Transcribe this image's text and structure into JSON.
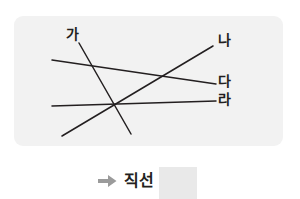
{
  "figure": {
    "panel": {
      "background_color": "#f2f2f2",
      "corner_radius": 9
    },
    "line_color": "#231f20",
    "labels": [
      {
        "id": "ga",
        "text": "가"
      },
      {
        "id": "na",
        "text": "나"
      },
      {
        "id": "da",
        "text": "다"
      },
      {
        "id": "ra",
        "text": "라"
      }
    ],
    "lines": [
      {
        "name": "line-ga",
        "label": "가",
        "x1": 79,
        "y1": 43,
        "x2": 131,
        "y2": 134
      },
      {
        "name": "line-na",
        "label": "나",
        "x1": 62,
        "y1": 136,
        "x2": 213,
        "y2": 46
      },
      {
        "name": "line-da",
        "label": "다",
        "x1": 52,
        "y1": 60,
        "x2": 216,
        "y2": 84
      },
      {
        "name": "line-ra",
        "label": "라",
        "x1": 52,
        "y1": 106,
        "x2": 216,
        "y2": 101
      }
    ]
  },
  "caption": {
    "arrow_icon": "right-arrow-icon",
    "arrow_color": "#9b9b9b",
    "text": "직선",
    "answer_blank": {
      "value": "",
      "fill_color": "#e9e9e9"
    }
  }
}
